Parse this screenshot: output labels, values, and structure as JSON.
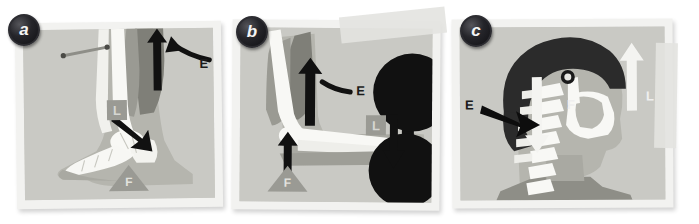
{
  "figure": {
    "type": "three-panel anatomical lever diagram",
    "background_color": "#ffffff"
  },
  "panels": [
    {
      "id": "a",
      "badge": "a",
      "subject": "ankle and foot, plantarflexion (first/second-class lever)",
      "frame_color": "#f2f2f0",
      "canvas_color": "#c9c9c4",
      "labels": [
        {
          "key": "E",
          "text": "E",
          "meaning": "effort",
          "style": "black-text-with-black-arrow",
          "arrow": "up"
        },
        {
          "key": "L",
          "text": "L",
          "meaning": "load",
          "style": "gray-square-badge",
          "arrow": "down-left-into-ankle"
        },
        {
          "key": "F",
          "text": "F",
          "meaning": "fulcrum",
          "style": "gray-triangle",
          "arrow": "none"
        }
      ],
      "extras": [
        "scale-bar"
      ]
    },
    {
      "id": "b",
      "badge": "b",
      "subject": "elbow and forearm holding a dumbbell (third-class lever)",
      "frame_color": "#f2f2f0",
      "canvas_color": "#c9c9c4",
      "labels": [
        {
          "key": "E",
          "text": "E",
          "meaning": "effort",
          "style": "black-text-with-black-arrow",
          "arrow": "up"
        },
        {
          "key": "L",
          "text": "L",
          "meaning": "load",
          "style": "gray-square-badge",
          "arrow": "down"
        },
        {
          "key": "F",
          "text": "F",
          "meaning": "fulcrum",
          "style": "gray-triangle",
          "arrow": "up"
        }
      ],
      "extras": [
        "dumbbell-weight-top",
        "dumbbell-weight-bottom",
        "tape-strip"
      ]
    },
    {
      "id": "c",
      "badge": "c",
      "subject": "head, cervical spine and mandible (first-class lever)",
      "frame_color": "#f2f2f0",
      "canvas_color": "#c9c9c4",
      "labels": [
        {
          "key": "E",
          "text": "E",
          "meaning": "effort",
          "style": "black-text-with-black-arrow",
          "arrow": "down-right"
        },
        {
          "key": "F",
          "text": "F",
          "meaning": "fulcrum",
          "style": "white-text",
          "arrow": "none"
        },
        {
          "key": "L",
          "text": "L",
          "meaning": "load",
          "style": "white-text-with-white-arrow",
          "arrow": "up"
        }
      ],
      "extras": [
        "tape-strip"
      ]
    }
  ],
  "legend_keys": {
    "E": "Effort",
    "L": "Load",
    "F": "Fulcrum"
  },
  "colors": {
    "paper": "#f2f2f0",
    "canvas": "#c9c9c4",
    "bone": "#f7f7f4",
    "skin": "#b5b5ae",
    "muscle_dark": "#8a8a83",
    "muscle_light": "#a3a39c",
    "hair_black": "#2c2c2c",
    "arrow_black": "#111111",
    "label_gray": "#9a9a94",
    "weight_black": "#111111"
  }
}
